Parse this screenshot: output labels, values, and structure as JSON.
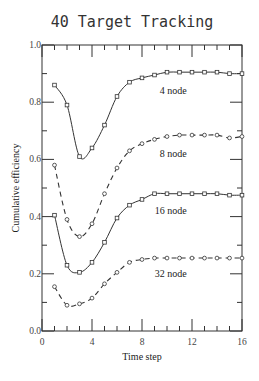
{
  "chart_data": {
    "type": "line",
    "title": "40 Target Tracking",
    "xlabel": "Time step",
    "ylabel": "Cumulative efficiency",
    "xlim": [
      0,
      16
    ],
    "ylim": [
      0.0,
      1.0
    ],
    "x_ticks": [
      0,
      4,
      8,
      12,
      16
    ],
    "x_tick_labels": [
      "0",
      "4",
      "8",
      "12",
      "16"
    ],
    "y_ticks": [
      0.0,
      0.2,
      0.4,
      0.6,
      0.8,
      1.0
    ],
    "y_tick_labels": [
      "0.0",
      "0.2",
      "0.4",
      "0.6",
      "0.8",
      "1.0"
    ],
    "grid": false,
    "legend": "inline labels",
    "x": [
      1,
      2,
      3,
      4,
      5,
      6,
      7,
      8,
      9,
      10,
      11,
      12,
      13,
      14,
      15,
      16
    ],
    "series": [
      {
        "name": "4 node",
        "label": "4 node",
        "line_style": "solid",
        "marker": "square",
        "values": [
          0.86,
          0.79,
          0.61,
          0.64,
          0.72,
          0.82,
          0.87,
          0.885,
          0.895,
          0.905,
          0.905,
          0.905,
          0.905,
          0.905,
          0.9,
          0.9
        ],
        "label_at": [
          10.5,
          0.83
        ]
      },
      {
        "name": "8 node",
        "label": "8 node",
        "line_style": "dashed",
        "marker": "circle",
        "values": [
          0.58,
          0.39,
          0.33,
          0.375,
          0.48,
          0.57,
          0.63,
          0.655,
          0.67,
          0.68,
          0.685,
          0.685,
          0.685,
          0.685,
          0.675,
          0.68
        ],
        "label_at": [
          10.5,
          0.61
        ]
      },
      {
        "name": "16 node",
        "label": "16 node",
        "line_style": "solid",
        "marker": "square",
        "values": [
          0.405,
          0.23,
          0.205,
          0.24,
          0.31,
          0.395,
          0.44,
          0.46,
          0.48,
          0.48,
          0.48,
          0.48,
          0.48,
          0.48,
          0.475,
          0.475
        ],
        "label_at": [
          10.3,
          0.41
        ]
      },
      {
        "name": "32 node",
        "label": "32 node",
        "line_style": "dashed",
        "marker": "circle",
        "values": [
          0.155,
          0.09,
          0.095,
          0.115,
          0.165,
          0.205,
          0.24,
          0.25,
          0.255,
          0.255,
          0.255,
          0.255,
          0.255,
          0.255,
          0.255,
          0.255
        ],
        "label_at": [
          10.3,
          0.19
        ]
      }
    ]
  }
}
